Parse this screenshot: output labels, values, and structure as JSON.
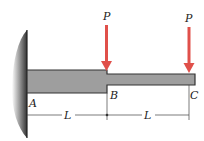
{
  "diagram": {
    "type": "stepped cantilever beam",
    "loads": [
      {
        "label": "P",
        "location": "B",
        "direction": "down"
      },
      {
        "label": "P",
        "location": "C",
        "direction": "down"
      }
    ],
    "points": {
      "a": "A",
      "b": "B",
      "c": "C"
    },
    "dimensions": [
      {
        "label": "L",
        "from": "A",
        "to": "B"
      },
      {
        "label": "L",
        "from": "B",
        "to": "C"
      }
    ],
    "colors": {
      "load": "#e0504a",
      "beam": "#9a9a9a",
      "wall": "#555555"
    }
  }
}
